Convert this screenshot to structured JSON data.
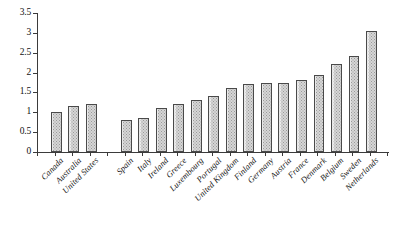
{
  "chart_data": {
    "type": "bar",
    "title": "",
    "subtitle": "",
    "xlabel": "",
    "ylabel": "",
    "ylim": [
      0,
      3.5
    ],
    "grid": false,
    "legend": null,
    "y_ticks": [
      "0",
      "0.5",
      "1",
      "1.5",
      "2",
      "2.5",
      "3",
      "3.5"
    ],
    "y_tick_values": [
      0,
      0.5,
      1,
      1.5,
      2,
      2.5,
      3,
      3.5
    ],
    "categories": [
      "Canada",
      "Australia",
      "United States",
      "Spain",
      "Italy",
      "Ireland",
      "Greece",
      "Luxembourg",
      "Portugal",
      "United Kingdom",
      "Finland",
      "Germany",
      "Austria",
      "France",
      "Denmark",
      "Belgium",
      "Sweden",
      "Netherlands"
    ],
    "values": [
      1.02,
      1.15,
      1.22,
      0.8,
      0.86,
      1.12,
      1.22,
      1.32,
      1.4,
      1.62,
      1.72,
      1.75,
      1.75,
      1.82,
      1.95,
      2.22,
      2.42,
      3.05
    ],
    "group_breaks": [
      3
    ],
    "bar_fill_color": "#d6d6d6",
    "bar_edge_color": "#4a4a4a",
    "axis_color": "#3b3b3b",
    "background_color": "#ffffff"
  }
}
